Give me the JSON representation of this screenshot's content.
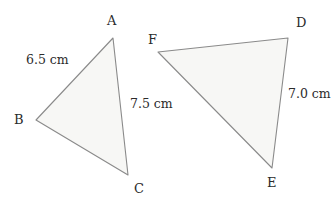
{
  "figure": {
    "type": "geometry-diagram",
    "canvas": {
      "width": 334,
      "height": 206
    },
    "colors": {
      "background": "#ffffff",
      "shape_fill": "#f7f7f5",
      "shape_stroke": "#8a8a8a",
      "text": "#2b2b2b"
    },
    "shapes": [
      {
        "name": "triangle-abc",
        "points": "113,38 36,120 128,175",
        "vertices": [
          {
            "label": "A",
            "x": 113,
            "y": 38
          },
          {
            "label": "B",
            "x": 36,
            "y": 120
          },
          {
            "label": "C",
            "x": 128,
            "y": 175
          }
        ]
      },
      {
        "name": "triangle-def",
        "points": "288,38 158,52 272,168",
        "vertices": [
          {
            "label": "D",
            "x": 288,
            "y": 38
          },
          {
            "label": "E",
            "x": 272,
            "y": 168
          },
          {
            "label": "F",
            "x": 158,
            "y": 52
          }
        ]
      }
    ],
    "vertex_labels": [
      {
        "name": "vertex-label-a",
        "text": "A",
        "left": 107,
        "top": 14
      },
      {
        "name": "vertex-label-b",
        "text": "B",
        "left": 14,
        "top": 113
      },
      {
        "name": "vertex-label-c",
        "text": "C",
        "left": 134,
        "top": 182
      },
      {
        "name": "vertex-label-d",
        "text": "D",
        "left": 296,
        "top": 16
      },
      {
        "name": "vertex-label-e",
        "text": "E",
        "left": 267,
        "top": 176
      },
      {
        "name": "vertex-label-f",
        "text": "F",
        "left": 148,
        "top": 33
      }
    ],
    "side_labels": [
      {
        "name": "side-label-ab",
        "text": "6.5 cm",
        "value": 6.5,
        "unit": "cm",
        "side": "AB",
        "left": 26,
        "top": 54
      },
      {
        "name": "side-label-ac",
        "text": "7.5 cm",
        "value": 7.5,
        "unit": "cm",
        "side": "AC",
        "left": 130,
        "top": 98
      },
      {
        "name": "side-label-de",
        "text": "7.0 cm",
        "value": 7.0,
        "unit": "cm",
        "side": "DE",
        "left": 288,
        "top": 88
      }
    ]
  }
}
